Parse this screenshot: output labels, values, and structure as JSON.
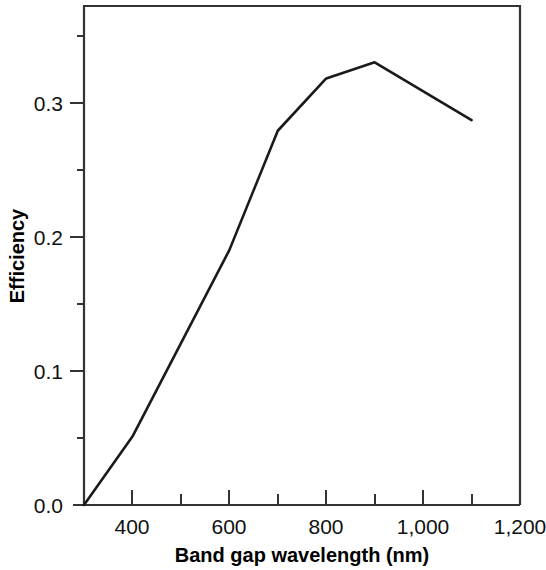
{
  "figure": {
    "background_color": "#ffffff",
    "line_color": "#1a1a1a",
    "axis_color": "#333333"
  },
  "axes": {
    "x_title": "Band gap wavelength (nm)",
    "y_title": "Efficiency",
    "x_tick_labels": [
      "400",
      "600",
      "800",
      "1,000",
      "1,200"
    ],
    "y_tick_labels": [
      "0.0",
      "0.1",
      "0.2",
      "0.3"
    ]
  },
  "chart_data": {
    "type": "line",
    "title": "",
    "xlabel": "Band gap wavelength (nm)",
    "ylabel": "Efficiency",
    "xlim": [
      300,
      1200
    ],
    "ylim": [
      0.0,
      0.372
    ],
    "grid": false,
    "legend": "none",
    "x_ticks_major": [
      400,
      600,
      800,
      1000,
      1200
    ],
    "x_ticks_minor": [
      300,
      500,
      700,
      900,
      1100
    ],
    "y_ticks_major": [
      0.0,
      0.1,
      0.2,
      0.3
    ],
    "y_ticks_minor": [
      0.05,
      0.15,
      0.25,
      0.35
    ],
    "x": [
      300,
      400,
      600,
      700,
      800,
      900,
      1100
    ],
    "y": [
      0.0,
      0.051,
      0.19,
      0.279,
      0.318,
      0.33,
      0.287
    ],
    "series": [
      {
        "name": "Efficiency",
        "points": [
          {
            "x": 300,
            "y": 0.0
          },
          {
            "x": 400,
            "y": 0.051
          },
          {
            "x": 600,
            "y": 0.19
          },
          {
            "x": 700,
            "y": 0.279
          },
          {
            "x": 800,
            "y": 0.318
          },
          {
            "x": 900,
            "y": 0.33
          },
          {
            "x": 1100,
            "y": 0.287
          }
        ]
      }
    ]
  }
}
